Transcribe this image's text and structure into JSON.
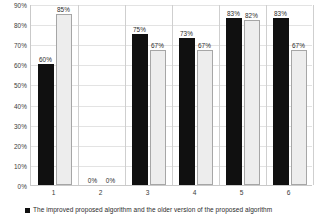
{
  "chart_data": {
    "type": "bar",
    "title": "",
    "xlabel": "",
    "ylabel": "",
    "ylim": [
      0,
      90
    ],
    "grid": true,
    "legend_position": "bottom-left",
    "categories": [
      "1",
      "2",
      "3",
      "4",
      "5",
      "6"
    ],
    "ytick_labels": [
      "0%",
      "10%",
      "20%",
      "30%",
      "40%",
      "50%",
      "60%",
      "70%",
      "80%",
      "90%"
    ],
    "ytick_values": [
      0,
      10,
      20,
      30,
      40,
      50,
      60,
      70,
      80,
      90
    ],
    "series": [
      {
        "name": "The improved proposed algorithm",
        "color": "#101010",
        "values": [
          60,
          0,
          75,
          73,
          83,
          83
        ],
        "data_labels": [
          "60%",
          "0%",
          "75%",
          "73%",
          "83%",
          "83%"
        ]
      },
      {
        "name": "the older version of the proposed algorithm",
        "color": "#ededed",
        "values": [
          85,
          0,
          67,
          67,
          82,
          67
        ],
        "data_labels": [
          "85%",
          "0%",
          "67%",
          "67%",
          "82%",
          "67%"
        ]
      }
    ],
    "legend_entries": [
      {
        "marker": "dark-square",
        "color": "#101010",
        "label": "The improved proposed algorithm and the older version of the proposed algorithm"
      }
    ]
  }
}
